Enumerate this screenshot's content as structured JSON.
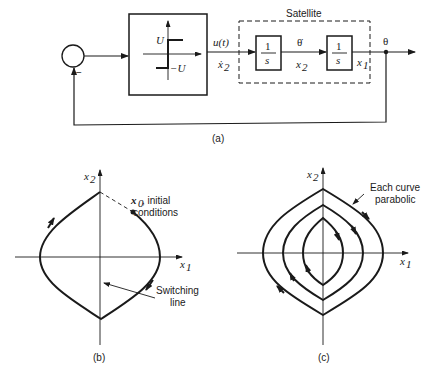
{
  "colors": {
    "ink": "#1a1a1a",
    "background": "#ffffff"
  },
  "panel_a": {
    "caption": "(a)",
    "summing_junction": {
      "sign": "−"
    },
    "relay_block": {
      "upper_level": "U",
      "lower_level": "−U"
    },
    "control_signal": {
      "top": "u(t)",
      "bottom": "ẋ",
      "bottom_sub": "2"
    },
    "satellite": {
      "title": "Satellite",
      "integrator1": {
        "num": "1",
        "den": "s"
      },
      "between": {
        "top": "θ̇",
        "bottom": "x",
        "bottom_sub": "2"
      },
      "integrator2": {
        "num": "1",
        "den": "s"
      },
      "out_state": {
        "label": "x",
        "sub": "1"
      }
    },
    "output": "θ"
  },
  "panel_b": {
    "caption": "(b)",
    "x_axis": {
      "label": "x",
      "sub": "1"
    },
    "y_axis": {
      "label": "x",
      "sub": "2"
    },
    "initial": {
      "label": "x",
      "sub": "0",
      "line1": ", initial",
      "line2": "conditions"
    },
    "switching": {
      "line1": "Switching",
      "line2": "line"
    }
  },
  "panel_c": {
    "caption": "(c)",
    "x_axis": {
      "label": "x",
      "sub": "1"
    },
    "y_axis": {
      "label": "x",
      "sub": "2"
    },
    "note": {
      "line1": "Each curve",
      "line2": "parabolic"
    }
  }
}
